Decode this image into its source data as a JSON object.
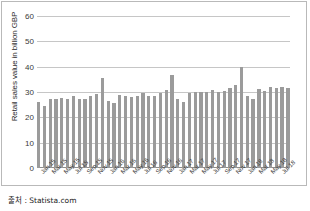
{
  "chart_data": {
    "type": "bar",
    "title": "",
    "xlabel": "",
    "ylabel": "Retail sales value in billion GBP",
    "ylim": [
      0,
      60
    ],
    "yticks": [
      0,
      10,
      20,
      30,
      40,
      50,
      60
    ],
    "grid": true,
    "legend": null,
    "bar_color": "#9b9b9b",
    "categories": [
      "Jan 15",
      "Feb 15",
      "Mar 15",
      "Apr 15",
      "May 15",
      "Jun 15",
      "Jul 15",
      "Aug 15",
      "Sep 15",
      "Oct 15",
      "Nov 15",
      "Dec 15",
      "Jan 16",
      "Feb 16",
      "Mar 16",
      "Apr 16",
      "May 16",
      "Jun 16",
      "Jul 16",
      "Aug 16",
      "Sep 16",
      "Oct 16",
      "Nov 16",
      "Dec 16",
      "Jan 17",
      "Feb 17",
      "Mar 17",
      "Apr 17",
      "May 17",
      "Jun 17",
      "Jul 17",
      "Aug 17",
      "Sep 17",
      "Oct 17",
      "Nov 17",
      "Dec 17",
      "Jan 18",
      "Feb 18",
      "Mar 18",
      "Apr 18",
      "May 18",
      "Jun 18",
      "Jul 18",
      "Aug 18"
    ],
    "values": [
      26.0,
      24.4,
      27.3,
      27.2,
      27.6,
      27.2,
      28.3,
      27.4,
      27.4,
      28.6,
      29.4,
      35.6,
      26.6,
      25.8,
      28.8,
      28.4,
      28.2,
      28.6,
      29.5,
      28.6,
      28.6,
      29.7,
      30.6,
      36.9,
      27.3,
      26.0,
      29.6,
      30.2,
      30.0,
      30.1,
      30.7,
      30.2,
      30.4,
      31.4,
      32.7,
      39.7,
      28.6,
      27.2,
      31.2,
      30.4,
      31.8,
      31.6,
      32.0,
      31.4
    ],
    "tick_labels": [
      {
        "index": 0,
        "label": "Jan 15"
      },
      {
        "index": 2,
        "label": "Mar 15"
      },
      {
        "index": 4,
        "label": "May 15"
      },
      {
        "index": 6,
        "label": "Jul 15"
      },
      {
        "index": 8,
        "label": "Sep 15"
      },
      {
        "index": 10,
        "label": "Nov 15"
      },
      {
        "index": 12,
        "label": "Jan 16"
      },
      {
        "index": 14,
        "label": "Mar 16"
      },
      {
        "index": 16,
        "label": "May 16"
      },
      {
        "index": 18,
        "label": "Jul 16"
      },
      {
        "index": 20,
        "label": "Sep 16"
      },
      {
        "index": 22,
        "label": "Nov 16"
      },
      {
        "index": 24,
        "label": "Jan 17"
      },
      {
        "index": 26,
        "label": "Mar 17"
      },
      {
        "index": 28,
        "label": "May 17"
      },
      {
        "index": 30,
        "label": "Jul 17"
      },
      {
        "index": 32,
        "label": "Sep 17"
      },
      {
        "index": 34,
        "label": "Nov 17"
      },
      {
        "index": 36,
        "label": "Jan 18"
      },
      {
        "index": 38,
        "label": "Mar 18"
      },
      {
        "index": 40,
        "label": "May 18"
      },
      {
        "index": 42,
        "label": "Jul 18"
      }
    ]
  },
  "footer": {
    "source": "출처 : Statista.com"
  }
}
